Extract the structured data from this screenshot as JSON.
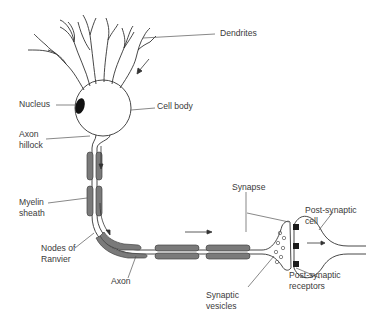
{
  "diagram": {
    "colors": {
      "line": "#333333",
      "myelin": "#7a7a7a",
      "nucleus": "#111111",
      "receptor": "#1a1a1a",
      "label": "#3a3a3a",
      "background": "#ffffff"
    },
    "labels": {
      "dendrites": "Dendrites",
      "nucleus": "Nucleus",
      "cell_body": "Cell body",
      "axon_hillock": "Axon\nhillock",
      "myelin_sheath": "Myelin\nsheath",
      "nodes_of_ranvier": "Nodes of\nRanvier",
      "axon": "Axon",
      "synapse": "Synapse",
      "post_synaptic_cell": "Post-synaptic\ncell",
      "synaptic_vesicles": "Synaptic\nvesicles",
      "post_synaptic_receptors": "Post-synaptic\nreceptors"
    },
    "arrows": [
      {
        "name": "signal-direction-dendrites",
        "direction": "down-left"
      },
      {
        "name": "signal-direction-axon-vertical",
        "direction": "down"
      },
      {
        "name": "signal-direction-axon-bend",
        "direction": "curve-down-right"
      },
      {
        "name": "signal-direction-axon-horizontal",
        "direction": "right"
      },
      {
        "name": "signal-direction-synapse",
        "direction": "right"
      }
    ]
  }
}
